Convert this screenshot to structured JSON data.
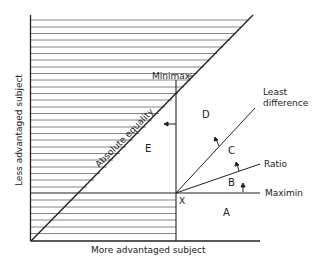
{
  "diagram": {
    "axes": {
      "x_label": "More advantaged subject",
      "y_label": "Less advantaged subject"
    },
    "lines": {
      "equality_label": "Absolute equality",
      "minimax_label": "Minimax",
      "least_difference_label_1": "Least",
      "least_difference_label_2": "difference",
      "ratio_label": "Ratio",
      "maximin_label": "Maximin"
    },
    "point": {
      "label": "X"
    },
    "regions": {
      "a": "A",
      "b": "B",
      "c": "C",
      "d": "D",
      "e": "E"
    },
    "colors": {
      "line": "#222222",
      "hatch": "#555555",
      "background": "#ffffff"
    }
  }
}
